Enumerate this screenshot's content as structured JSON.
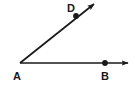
{
  "figure": {
    "kind": "geometry-angle-diagram",
    "width": 136,
    "height": 88,
    "background_color": "#ffffff",
    "stroke_color": "#1a1a1a",
    "stroke_width": 1.6
  },
  "labels": {
    "vertex": "A",
    "point_on_horizontal_ray": "B",
    "point_on_oblique_ray": "D"
  },
  "points": {
    "A": {
      "label": "A",
      "x": 20,
      "y": 63,
      "dot": false,
      "label_x": 16,
      "label_y": 79
    },
    "B": {
      "label": "B",
      "x": 105,
      "y": 63,
      "dot": true,
      "dot_radius": 2.8,
      "label_x": 104,
      "label_y": 79
    },
    "D": {
      "label": "D",
      "x": 76,
      "y": 16,
      "dot": true,
      "dot_radius": 2.8,
      "label_x": 70,
      "label_y": 11
    }
  },
  "rays": [
    {
      "name": "ray-AB",
      "from": "A",
      "through": "B",
      "x1": 20,
      "y1": 63,
      "x2": 128,
      "y2": 63,
      "arrowhead": true
    },
    {
      "name": "ray-AD",
      "from": "A",
      "through": "D",
      "x1": 20,
      "y1": 63,
      "x2": 94,
      "y2": 4,
      "arrowhead": true
    }
  ],
  "arrowhead": {
    "length": 7,
    "width": 5,
    "color": "#1a1a1a"
  }
}
